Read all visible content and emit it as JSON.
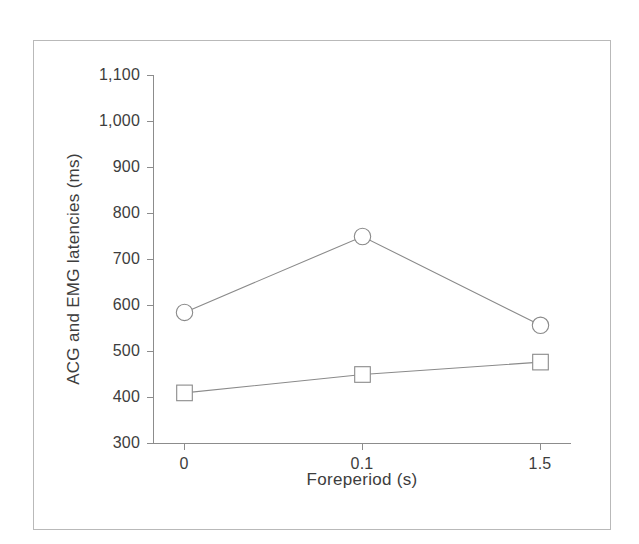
{
  "chart_data": {
    "type": "line",
    "title": "",
    "subtitle": "",
    "xlabel": "Foreperiod  (s)",
    "ylabel": "ACG and EMG latencies  (ms)",
    "categories": [
      "0",
      "0.1",
      "1.5"
    ],
    "xtick_labels": [
      "0",
      "0.1",
      "1.5"
    ],
    "ytick_labels": [
      "300",
      "400",
      "500",
      "600",
      "700",
      "800",
      "900",
      "1,000",
      "1,100"
    ],
    "ytick_values": [
      300,
      400,
      500,
      600,
      700,
      800,
      900,
      1000,
      1100
    ],
    "ylim": [
      300,
      1100
    ],
    "grid": false,
    "legend": "none",
    "series": [
      {
        "name": "ACG latency",
        "marker": "circle",
        "color": "#8a8a8a",
        "values": [
          585,
          750,
          557
        ]
      },
      {
        "name": "EMG latency",
        "marker": "square",
        "color": "#8a8a8a",
        "values": [
          410,
          450,
          477
        ]
      }
    ],
    "annotations": []
  },
  "figure": {
    "frame_color": "#b9b9b9",
    "background": "#ffffff",
    "axis_color": "#8c8c8c",
    "text_color": "#3d3d3d"
  }
}
